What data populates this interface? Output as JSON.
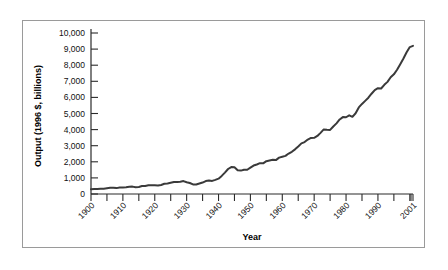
{
  "chart_data": {
    "type": "line",
    "title": "",
    "xlabel": "Year",
    "ylabel": "Output (1996 $, billions)",
    "xlim": [
      1900,
      2001
    ],
    "ylim": [
      0,
      10000
    ],
    "grid": false,
    "legend": null,
    "y_ticks": [
      0,
      1000,
      2000,
      3000,
      4000,
      5000,
      6000,
      7000,
      8000,
      9000,
      10000
    ],
    "y_tick_labels": [
      "0",
      "1,000",
      "2,000",
      "3,000",
      "4,000",
      "5,000",
      "6,000",
      "7,000",
      "8,000",
      "9,000",
      "10,000"
    ],
    "x_ticks": [
      1900,
      1910,
      1920,
      1930,
      1940,
      1950,
      1960,
      1970,
      1980,
      1990,
      2001
    ],
    "x_tick_labels": [
      "1900",
      "1910",
      "1920",
      "1930",
      "1940",
      "1950",
      "1960",
      "1970",
      "1980",
      "1990",
      "2001"
    ],
    "x_minor_tick_step": 5,
    "series_name": "Output",
    "line_color": "#3a3a3a",
    "x": [
      1900,
      1901,
      1902,
      1903,
      1904,
      1905,
      1906,
      1907,
      1908,
      1909,
      1910,
      1911,
      1912,
      1913,
      1914,
      1915,
      1916,
      1917,
      1918,
      1919,
      1920,
      1921,
      1922,
      1923,
      1924,
      1925,
      1926,
      1927,
      1928,
      1929,
      1930,
      1931,
      1932,
      1933,
      1934,
      1935,
      1936,
      1937,
      1938,
      1939,
      1940,
      1941,
      1942,
      1943,
      1944,
      1945,
      1946,
      1947,
      1948,
      1949,
      1950,
      1951,
      1952,
      1953,
      1954,
      1955,
      1956,
      1957,
      1958,
      1959,
      1960,
      1961,
      1962,
      1963,
      1964,
      1965,
      1966,
      1967,
      1968,
      1969,
      1970,
      1971,
      1972,
      1973,
      1974,
      1975,
      1976,
      1977,
      1978,
      1979,
      1980,
      1981,
      1982,
      1983,
      1984,
      1985,
      1986,
      1987,
      1988,
      1989,
      1990,
      1991,
      1992,
      1993,
      1994,
      1995,
      1996,
      1997,
      1998,
      1999,
      2000,
      2001
    ],
    "values": [
      400,
      420,
      430,
      450,
      445,
      480,
      520,
      530,
      495,
      545,
      555,
      575,
      605,
      620,
      575,
      590,
      670,
      680,
      740,
      745,
      735,
      720,
      760,
      860,
      885,
      945,
      1005,
      1015,
      1025,
      1085,
      990,
      925,
      805,
      795,
      880,
      960,
      1085,
      1140,
      1100,
      1190,
      1290,
      1520,
      1800,
      2100,
      2265,
      2240,
      1990,
      1965,
      2045,
      2035,
      2215,
      2390,
      2480,
      2595,
      2575,
      2760,
      2820,
      2875,
      2850,
      3055,
      3130,
      3205,
      3400,
      3550,
      3755,
      3995,
      4255,
      4365,
      4575,
      4715,
      4725,
      4880,
      5140,
      5430,
      5400,
      5385,
      5675,
      5935,
      6265,
      6465,
      6450,
      6615,
      6485,
      6785,
      7275,
      7570,
      7830,
      8095,
      8430,
      8730,
      8890,
      8870,
      9175,
      9425,
      9810,
      10060,
      10440,
      10910,
      11390,
      11920,
      12350,
      12450
    ],
    "values_note": "Plotted curve values in billions of 1996 dollars, read from the axis scale; final 2001 point reaches roughly 9,200 on the drawn axis."
  }
}
